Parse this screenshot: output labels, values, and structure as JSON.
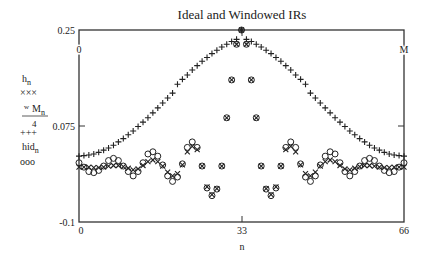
{
  "chart_data": {
    "type": "scatter",
    "title": "Ideal and Windowed IRs",
    "xlabel": "n",
    "ylabel": "",
    "xlim": [
      0,
      66
    ],
    "ylim": [
      -0.1,
      0.25
    ],
    "grid": false,
    "x_ticks": [
      "0",
      "33",
      "66"
    ],
    "y_ticks": [
      "0.25",
      "0.075",
      "-0.1"
    ],
    "top_axis_labels": {
      "left": "0",
      "right": "M"
    },
    "legend": [
      {
        "label": "h_n",
        "marker": "×××"
      },
      {
        "label": "w M_n / 4",
        "marker": "+++"
      },
      {
        "label": "hid_n",
        "marker": "ooo"
      }
    ],
    "x": [
      0,
      1,
      2,
      3,
      4,
      5,
      6,
      7,
      8,
      9,
      10,
      11,
      12,
      13,
      14,
      15,
      16,
      17,
      18,
      19,
      20,
      21,
      22,
      23,
      24,
      25,
      26,
      27,
      28,
      29,
      30,
      31,
      32,
      33,
      34,
      35,
      36,
      37,
      38,
      39,
      40,
      41,
      42,
      43,
      44,
      45,
      46,
      47,
      48,
      49,
      50,
      51,
      52,
      53,
      54,
      55,
      56,
      57,
      58,
      59,
      60,
      61,
      62,
      63,
      64,
      65,
      66
    ],
    "series": [
      {
        "name": "hid_n",
        "marker": "circle",
        "values": [
          0.008,
          0.0,
          -0.008,
          -0.01,
          -0.006,
          0.002,
          0.012,
          0.016,
          0.012,
          0.002,
          -0.008,
          -0.016,
          -0.008,
          0.008,
          0.024,
          0.028,
          0.02,
          0.004,
          -0.016,
          -0.026,
          -0.018,
          0.006,
          0.036,
          0.046,
          0.036,
          0.002,
          -0.038,
          -0.052,
          -0.04,
          0.002,
          0.09,
          0.159,
          0.224,
          0.25,
          0.224,
          0.159,
          0.09,
          0.002,
          -0.04,
          -0.052,
          -0.038,
          0.002,
          0.036,
          0.046,
          0.036,
          0.006,
          -0.018,
          -0.026,
          -0.016,
          0.004,
          0.02,
          0.028,
          0.024,
          0.008,
          -0.008,
          -0.016,
          -0.008,
          0.002,
          0.012,
          0.016,
          0.012,
          0.002,
          -0.006,
          -0.01,
          -0.008,
          0.0,
          0.008
        ]
      },
      {
        "name": "h_n",
        "marker": "x",
        "values": [
          0.0,
          0.0,
          0.0,
          -0.001,
          -0.001,
          0.0,
          0.002,
          0.003,
          0.003,
          0.001,
          -0.002,
          -0.005,
          -0.003,
          0.003,
          0.01,
          0.013,
          0.01,
          0.002,
          -0.009,
          -0.016,
          -0.012,
          0.004,
          0.028,
          0.038,
          0.032,
          0.002,
          -0.036,
          -0.05,
          -0.039,
          0.002,
          0.09,
          0.159,
          0.224,
          0.25,
          0.224,
          0.159,
          0.09,
          0.002,
          -0.039,
          -0.05,
          -0.036,
          0.002,
          0.032,
          0.038,
          0.028,
          0.004,
          -0.012,
          -0.016,
          -0.009,
          0.002,
          0.01,
          0.013,
          0.01,
          0.003,
          -0.003,
          -0.005,
          -0.002,
          0.001,
          0.003,
          0.003,
          0.002,
          0.0,
          -0.001,
          -0.001,
          0.0,
          0.0,
          0.0
        ]
      },
      {
        "name": "w M_n / 4",
        "marker": "plus",
        "values": [
          0.02,
          0.021,
          0.022,
          0.024,
          0.027,
          0.031,
          0.035,
          0.04,
          0.046,
          0.052,
          0.059,
          0.066,
          0.074,
          0.082,
          0.09,
          0.099,
          0.108,
          0.117,
          0.126,
          0.135,
          0.151,
          0.16,
          0.168,
          0.177,
          0.185,
          0.193,
          0.2,
          0.207,
          0.213,
          0.219,
          0.224,
          0.229,
          0.233,
          0.25,
          0.233,
          0.229,
          0.224,
          0.219,
          0.213,
          0.207,
          0.2,
          0.193,
          0.185,
          0.177,
          0.168,
          0.16,
          0.151,
          0.135,
          0.126,
          0.117,
          0.108,
          0.099,
          0.09,
          0.082,
          0.074,
          0.066,
          0.059,
          0.052,
          0.046,
          0.04,
          0.035,
          0.031,
          0.027,
          0.024,
          0.022,
          0.021,
          0.02
        ]
      }
    ]
  }
}
